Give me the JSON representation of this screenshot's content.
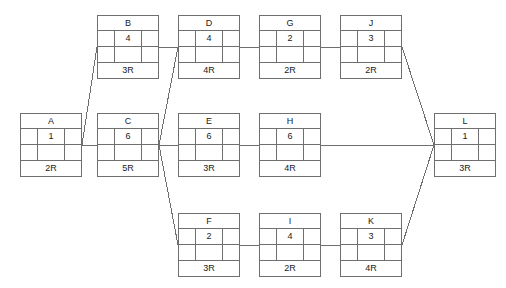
{
  "diagram": {
    "type": "activity-on-node-network-diagram",
    "background_color": "#ffffff",
    "line_color": "#6f6f6f",
    "text_color": "#1a1a1a",
    "nodes": [
      {
        "id": "A",
        "name": "A",
        "value": "1",
        "duration": "2R",
        "x": 20,
        "y": 113
      },
      {
        "id": "B",
        "name": "B",
        "value": "4",
        "duration": "3R",
        "x": 97,
        "y": 15
      },
      {
        "id": "C",
        "name": "C",
        "value": "6",
        "duration": "5R",
        "x": 97,
        "y": 113
      },
      {
        "id": "D",
        "name": "D",
        "value": "4",
        "duration": "4R",
        "x": 178,
        "y": 15
      },
      {
        "id": "E",
        "name": "E",
        "value": "6",
        "duration": "3R",
        "x": 178,
        "y": 113
      },
      {
        "id": "F",
        "name": "F",
        "value": "2",
        "duration": "3R",
        "x": 178,
        "y": 213
      },
      {
        "id": "G",
        "name": "G",
        "value": "2",
        "duration": "2R",
        "x": 259,
        "y": 15
      },
      {
        "id": "H",
        "name": "H",
        "value": "6",
        "duration": "4R",
        "x": 259,
        "y": 113
      },
      {
        "id": "I",
        "name": "I",
        "value": "4",
        "duration": "2R",
        "x": 259,
        "y": 213
      },
      {
        "id": "J",
        "name": "J",
        "value": "3",
        "duration": "2R",
        "x": 340,
        "y": 15
      },
      {
        "id": "K",
        "name": "K",
        "value": "3",
        "duration": "4R",
        "x": 340,
        "y": 213
      },
      {
        "id": "L",
        "name": "L",
        "value": "1",
        "duration": "3R",
        "x": 434,
        "y": 113
      }
    ],
    "edges": [
      {
        "from": "A",
        "to": "B",
        "x1": 82,
        "y1": 145,
        "x2": 97,
        "y2": 47
      },
      {
        "from": "A",
        "to": "C",
        "x1": 82,
        "y1": 145,
        "x2": 97,
        "y2": 145
      },
      {
        "from": "C",
        "to": "D",
        "x1": 159,
        "y1": 145,
        "x2": 178,
        "y2": 47
      },
      {
        "from": "C",
        "to": "E",
        "x1": 159,
        "y1": 145,
        "x2": 178,
        "y2": 145
      },
      {
        "from": "C",
        "to": "F",
        "x1": 159,
        "y1": 145,
        "x2": 178,
        "y2": 245
      },
      {
        "from": "B",
        "to": "D",
        "x1": 159,
        "y1": 47,
        "x2": 178,
        "y2": 47
      },
      {
        "from": "D",
        "to": "G",
        "x1": 240,
        "y1": 47,
        "x2": 259,
        "y2": 47
      },
      {
        "from": "G",
        "to": "J",
        "x1": 321,
        "y1": 47,
        "x2": 340,
        "y2": 47
      },
      {
        "from": "E",
        "to": "H",
        "x1": 240,
        "y1": 145,
        "x2": 259,
        "y2": 145
      },
      {
        "from": "F",
        "to": "I",
        "x1": 240,
        "y1": 245,
        "x2": 259,
        "y2": 245
      },
      {
        "from": "I",
        "to": "K",
        "x1": 321,
        "y1": 245,
        "x2": 340,
        "y2": 245
      },
      {
        "from": "J",
        "to": "L",
        "x1": 402,
        "y1": 47,
        "x2": 434,
        "y2": 145
      },
      {
        "from": "H",
        "to": "L",
        "x1": 321,
        "y1": 145,
        "x2": 434,
        "y2": 145
      },
      {
        "from": "K",
        "to": "L",
        "x1": 402,
        "y1": 245,
        "x2": 434,
        "y2": 145
      }
    ]
  }
}
